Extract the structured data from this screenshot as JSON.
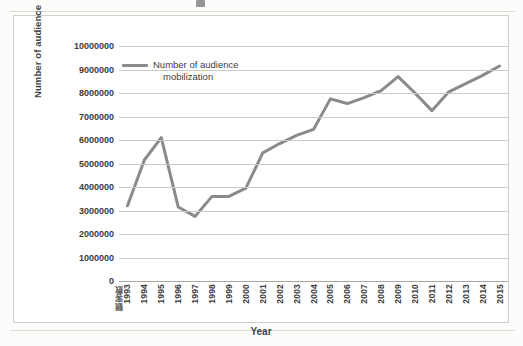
{
  "chart_data": {
    "type": "line",
    "title": "",
    "xlabel": "Year",
    "ylabel": "Number of audience",
    "origin_corner_label": "観客数",
    "legend": [
      "Number of audience mobilization"
    ],
    "legend_position": "inside-top-left",
    "grid": true,
    "ylim": [
      0,
      10000000
    ],
    "ytick_labels": [
      "10000000",
      "9000000",
      "8000000",
      "7000000",
      "6000000",
      "5000000",
      "4000000",
      "3000000",
      "2000000",
      "1000000",
      "0"
    ],
    "yticks": [
      10000000,
      9000000,
      8000000,
      7000000,
      6000000,
      5000000,
      4000000,
      3000000,
      2000000,
      1000000,
      0
    ],
    "categories": [
      "1993",
      "1994",
      "1995",
      "1996",
      "1997",
      "1998",
      "1999",
      "2000",
      "2001",
      "2002",
      "2003",
      "2004",
      "2005",
      "2006",
      "2007",
      "2008",
      "2009",
      "2010",
      "2011",
      "2012",
      "2013",
      "2014",
      "2015"
    ],
    "series": [
      {
        "name": "Number of audience mobilization",
        "color": "#8c8a87",
        "values": [
          3200000,
          5150000,
          6100000,
          3150000,
          2750000,
          3600000,
          3600000,
          3950000,
          5450000,
          5850000,
          6200000,
          6450000,
          7750000,
          7550000,
          7800000,
          8100000,
          8700000,
          8000000,
          7250000,
          8050000,
          8400000,
          8750000,
          9150000
        ]
      }
    ]
  },
  "chart": {
    "line_color": "#8c8a87",
    "grid_color": "#cbc9c6",
    "axis_color": "#a9a7a4",
    "background": "#ffffff",
    "frame_border": "#cfcdc9"
  },
  "legend": {
    "line1": "Number of audience",
    "line2": "mobilization"
  }
}
